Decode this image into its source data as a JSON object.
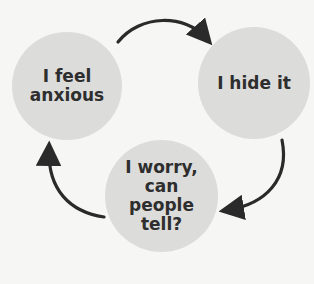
{
  "diagram": {
    "type": "cycle",
    "nodes": [
      {
        "id": "n1",
        "label": "I feel anxious",
        "lines": [
          "I feel",
          "anxious"
        ]
      },
      {
        "id": "n2",
        "label": "I hide it",
        "lines": [
          "I hide it"
        ]
      },
      {
        "id": "n3",
        "label": "I worry, can people tell?",
        "lines": [
          "I worry,",
          "can",
          "people",
          "tell?"
        ]
      }
    ],
    "edges": [
      {
        "from": "n1",
        "to": "n2"
      },
      {
        "from": "n2",
        "to": "n3"
      },
      {
        "from": "n3",
        "to": "n1"
      }
    ],
    "colors": {
      "background": "#f6f6f4",
      "node_fill": "#dcdcdb",
      "text": "#2e2e2e",
      "arrow": "#2a2a2a"
    }
  }
}
